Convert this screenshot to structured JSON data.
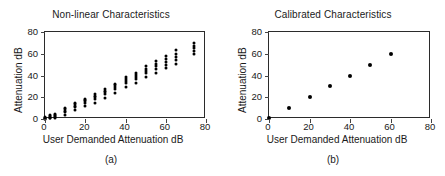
{
  "figure": {
    "background": "#ffffff",
    "marker_color": "#000000",
    "axis_color": "#2b2b2b"
  },
  "panels": [
    {
      "caption": "(a)",
      "chart_data": {
        "type": "scatter",
        "title": "Non-linear Characteristics",
        "xlabel": "User Demanded Attenuation dB",
        "ylabel": "Attenuation dB",
        "xlim": [
          0,
          80
        ],
        "ylim": [
          0,
          80
        ],
        "xticks": [
          0,
          20,
          40,
          60,
          80
        ],
        "yticks": [
          0,
          20,
          40,
          60,
          80
        ],
        "grid": false,
        "legend": "none",
        "note": "Each demanded attenuation setting produces a vertical cluster of measured attenuation values; spread widens with level.",
        "series": [
          {
            "name": "measured attenuation",
            "points": [
              [
                0,
                0.3
              ],
              [
                0,
                0.8
              ],
              [
                0,
                1.3
              ],
              [
                0,
                1.8
              ],
              [
                0,
                0.1
              ],
              [
                2.5,
                1.0
              ],
              [
                2.5,
                1.8
              ],
              [
                2.5,
                2.6
              ],
              [
                2.5,
                3.4
              ],
              [
                2.5,
                0.5
              ],
              [
                5,
                2.0
              ],
              [
                5,
                3.0
              ],
              [
                5,
                4.0
              ],
              [
                5,
                5.0
              ],
              [
                5,
                1.2
              ],
              [
                10,
                6.5
              ],
              [
                10,
                7.8
              ],
              [
                10,
                9.0
              ],
              [
                10,
                10.2
              ],
              [
                10,
                3.5
              ],
              [
                15,
                11.0
              ],
              [
                15,
                12.3
              ],
              [
                15,
                13.6
              ],
              [
                15,
                14.8
              ],
              [
                15,
                8.0
              ],
              [
                20,
                15.0
              ],
              [
                20,
                16.3
              ],
              [
                20,
                17.6
              ],
              [
                20,
                18.8
              ],
              [
                20,
                11.5
              ],
              [
                25,
                18.5
              ],
              [
                25,
                20.0
              ],
              [
                25,
                21.5
              ],
              [
                25,
                23.0
              ],
              [
                25,
                15.0
              ],
              [
                30,
                23.0
              ],
              [
                30,
                24.6
              ],
              [
                30,
                26.2
              ],
              [
                30,
                27.8
              ],
              [
                30,
                19.5
              ],
              [
                35,
                27.5
              ],
              [
                35,
                29.2
              ],
              [
                35,
                30.9
              ],
              [
                35,
                32.5
              ],
              [
                35,
                24.0
              ],
              [
                40,
                33.0
              ],
              [
                40,
                35.0
              ],
              [
                40,
                37.0
              ],
              [
                40,
                39.0
              ],
              [
                40,
                29.0
              ],
              [
                45,
                36.5
              ],
              [
                45,
                38.5
              ],
              [
                45,
                40.5
              ],
              [
                45,
                42.5
              ],
              [
                45,
                33.0
              ],
              [
                50,
                42.0
              ],
              [
                50,
                44.2
              ],
              [
                50,
                46.4
              ],
              [
                50,
                48.5
              ],
              [
                50,
                38.5
              ],
              [
                55,
                46.0
              ],
              [
                55,
                48.5
              ],
              [
                55,
                51.0
              ],
              [
                55,
                53.5
              ],
              [
                55,
                42.0
              ],
              [
                60,
                50.0
              ],
              [
                60,
                52.7
              ],
              [
                60,
                55.4
              ],
              [
                60,
                58.0
              ],
              [
                60,
                46.5
              ],
              [
                65,
                54.0
              ],
              [
                65,
                57.0
              ],
              [
                65,
                60.0
              ],
              [
                65,
                63.0
              ],
              [
                65,
                50.5
              ],
              [
                74,
                60.0
              ],
              [
                74,
                62.5
              ],
              [
                74,
                65.0
              ],
              [
                74,
                67.5
              ],
              [
                74,
                70.0
              ]
            ]
          }
        ]
      }
    },
    {
      "caption": "(b)",
      "chart_data": {
        "type": "scatter",
        "title": "Calibrated Characteristics",
        "xlabel": "User Demanded Attenuation dB",
        "ylabel": "Attenuation dB",
        "xlim": [
          0,
          80
        ],
        "ylim": [
          0,
          80
        ],
        "xticks": [
          0,
          20,
          40,
          60,
          80
        ],
        "yticks": [
          0,
          20,
          40,
          60,
          80
        ],
        "grid": false,
        "legend": "none",
        "note": "After calibration each demanded value maps to a single measured point on the 1:1 line.",
        "series": [
          {
            "name": "measured attenuation",
            "points": [
              [
                0,
                0.5
              ],
              [
                10,
                10
              ],
              [
                20,
                20
              ],
              [
                30,
                30
              ],
              [
                40,
                40
              ],
              [
                50,
                50
              ],
              [
                60,
                60
              ]
            ]
          }
        ]
      }
    }
  ]
}
